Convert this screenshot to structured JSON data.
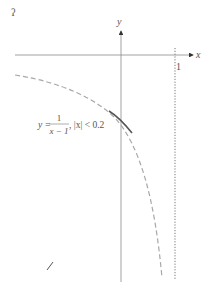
{
  "diagram": {
    "type": "function-graph",
    "axes": {
      "x_label": "x",
      "y_label": "y"
    },
    "asymptote": {
      "label": "1",
      "style": "dotted",
      "x_value": 1
    },
    "curve": {
      "equation_lhs": "y =",
      "fraction_numerator": "1",
      "fraction_denominator": "x − 1",
      "condition": ", |x| < 0.2",
      "style_full": "dashed",
      "style_highlight": "solid"
    },
    "corner_mark": "ʔ",
    "stray_mark": "/"
  },
  "colors": {
    "axis": "#8a8a8a",
    "curve_dashed": "#a8a8a8",
    "curve_solid": "#555555",
    "asymptote": "#777777",
    "text": "#555555"
  }
}
